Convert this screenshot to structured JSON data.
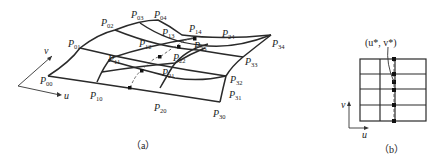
{
  "figure": {
    "panel_a": {
      "caption": "（a）",
      "axis_u": "u",
      "axis_v": "v",
      "control_points": [
        {
          "id": "P00",
          "base": "P",
          "sub": "00",
          "x": 33,
          "y": 84
        },
        {
          "id": "P10",
          "base": "P",
          "sub": "10",
          "x": 90,
          "y": 99
        },
        {
          "id": "P20",
          "base": "P",
          "sub": "20",
          "x": 154,
          "y": 111
        },
        {
          "id": "P30",
          "base": "P",
          "sub": "30",
          "x": 213,
          "y": 117
        },
        {
          "id": "P01",
          "base": "P",
          "sub": "01",
          "x": 68,
          "y": 47
        },
        {
          "id": "P11",
          "base": "P",
          "sub": "11",
          "x": 108,
          "y": 60
        },
        {
          "id": "P21",
          "base": "P",
          "sub": "21",
          "x": 162,
          "y": 75
        },
        {
          "id": "P31",
          "base": "P",
          "sub": "31",
          "x": 225,
          "y": 98
        },
        {
          "id": "P02",
          "base": "P",
          "sub": "02",
          "x": 101,
          "y": 26
        },
        {
          "id": "P12",
          "base": "P",
          "sub": "12",
          "x": 139,
          "y": 46
        },
        {
          "id": "P22",
          "base": "P",
          "sub": "22",
          "x": 173,
          "y": 61
        },
        {
          "id": "P32",
          "base": "P",
          "sub": "32",
          "x": 229,
          "y": 83
        },
        {
          "id": "P03",
          "base": "P",
          "sub": "03",
          "x": 131,
          "y": 17
        },
        {
          "id": "P13",
          "base": "P",
          "sub": "13",
          "x": 162,
          "y": 35
        },
        {
          "id": "P23",
          "base": "P",
          "sub": "23",
          "x": 194,
          "y": 49
        },
        {
          "id": "P33",
          "base": "P",
          "sub": "33",
          "x": 245,
          "y": 64
        },
        {
          "id": "P04",
          "base": "P",
          "sub": "04",
          "x": 154,
          "y": 17
        },
        {
          "id": "P14",
          "base": "P",
          "sub": "14",
          "x": 189,
          "y": 32
        },
        {
          "id": "P24",
          "base": "P",
          "sub": "24",
          "x": 222,
          "y": 37
        },
        {
          "id": "P34",
          "base": "P",
          "sub": "34",
          "x": 270,
          "y": 46
        }
      ]
    },
    "panel_b": {
      "caption": "（b）",
      "point_label": "(u*, v*)",
      "axis_u": "u",
      "axis_v": "v"
    }
  }
}
